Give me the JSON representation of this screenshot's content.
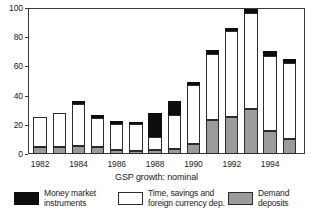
{
  "chart_data": {
    "type": "bar",
    "subtype": "stacked-vertical",
    "title": "",
    "caption": "GSP growth: nominal",
    "xlabel": "",
    "ylabel": "",
    "ylim": [
      0,
      100
    ],
    "yticks": [
      0,
      20,
      40,
      60,
      80,
      100
    ],
    "ytick_labels": [
      "0",
      "20",
      "40",
      "60",
      "80",
      "100"
    ],
    "grid": false,
    "legend_position": "bottom",
    "categories": [
      "1982",
      "1983",
      "1984",
      "1985",
      "1986",
      "1987",
      "1988",
      "1989",
      "1990",
      "1991",
      "1992",
      "1993",
      "1994",
      "1995"
    ],
    "xtick_labels_shown": [
      "1982",
      "1984",
      "1986",
      "1988",
      "1990",
      "1992",
      "1994"
    ],
    "series": [
      {
        "name": "Demand deposits",
        "color": "#9b9b9b",
        "values": [
          5.0,
          5.0,
          5.5,
          4.5,
          3.0,
          2.0,
          3.0,
          3.5,
          7.0,
          23.0,
          25.5,
          31.0,
          16.0,
          10.5
        ]
      },
      {
        "name": "Time, savings and foreign currency dep.",
        "color": "#ffffff",
        "values": [
          20.5,
          23.0,
          29.0,
          20.5,
          17.5,
          18.5,
          8.5,
          23.0,
          40.0,
          45.5,
          58.5,
          65.5,
          51.0,
          51.5
        ]
      },
      {
        "name": "Money market instruments",
        "color": "#0d0d0d",
        "values": [
          0.0,
          0.0,
          1.5,
          2.0,
          2.0,
          1.5,
          16.5,
          10.0,
          2.5,
          2.5,
          2.0,
          3.0,
          3.5,
          3.0
        ]
      }
    ],
    "totals": [
      25.5,
      28.0,
      36.0,
      27.0,
      22.5,
      22.0,
      28.0,
      36.5,
      49.5,
      71.0,
      86.0,
      99.5,
      70.5,
      65.0
    ]
  },
  "legend": {
    "items": [
      {
        "label": "Money market\ninstruments",
        "swatch": "money-market-swatch"
      },
      {
        "label": "Time, savings and\nforeign currency dep.",
        "swatch": "time-savings-swatch"
      },
      {
        "label": "Demand deposits",
        "swatch": "demand-deposits-swatch"
      }
    ]
  }
}
